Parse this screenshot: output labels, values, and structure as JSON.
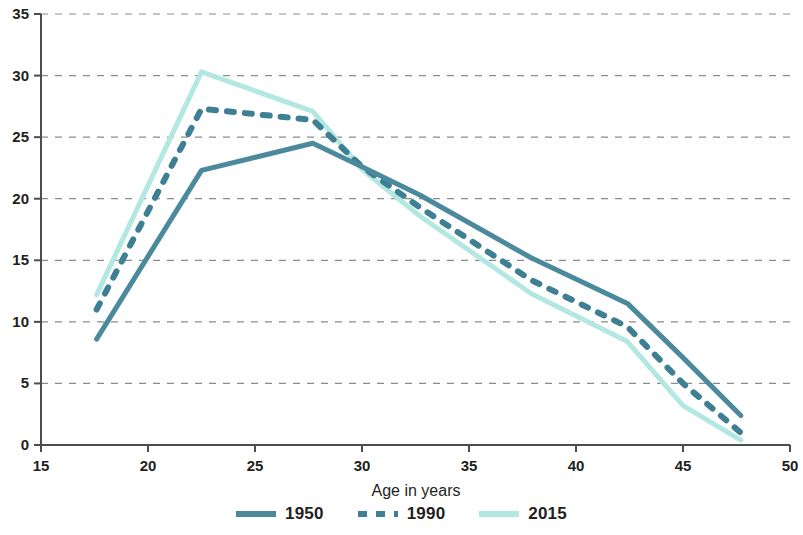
{
  "chart_data": {
    "type": "line",
    "title": "",
    "xlabel": "Age in years",
    "ylabel": "",
    "xlim": [
      15,
      50
    ],
    "ylim": [
      0,
      35
    ],
    "xticks": [
      15,
      20,
      25,
      30,
      35,
      40,
      45,
      50
    ],
    "yticks": [
      0,
      5,
      10,
      15,
      20,
      25,
      30,
      35
    ],
    "grid": "horizontal-dashed",
    "legend_position": "bottom-center",
    "series": [
      {
        "name": "1950",
        "color": "#4b8a9c",
        "style": "solid",
        "x": [
          17.6,
          22.5,
          27.7,
          30.0,
          32.7,
          37.9,
          42.4,
          45.0,
          47.7
        ],
        "y": [
          8.6,
          22.3,
          24.5,
          22.6,
          20.3,
          15.2,
          11.5,
          7.1,
          2.4
        ]
      },
      {
        "name": "1990",
        "color": "#3f7f93",
        "style": "dashed",
        "x": [
          17.6,
          22.5,
          27.7,
          30.0,
          32.7,
          37.9,
          42.4,
          45.0,
          47.7
        ],
        "y": [
          11.0,
          27.3,
          26.4,
          22.6,
          19.3,
          13.4,
          9.6,
          5.0,
          1.0
        ]
      },
      {
        "name": "2015",
        "color": "#b3e8e2",
        "style": "solid",
        "x": [
          17.6,
          22.5,
          27.7,
          30.0,
          32.7,
          37.9,
          42.4,
          45.0,
          47.7
        ],
        "y": [
          12.2,
          30.3,
          27.1,
          22.4,
          18.6,
          12.3,
          8.4,
          3.2,
          0.4
        ]
      }
    ]
  },
  "axes": {
    "x_title": "Age in years",
    "x_tick_labels": [
      "15",
      "20",
      "25",
      "30",
      "35",
      "40",
      "45",
      "50"
    ],
    "y_tick_labels": [
      "0",
      "5",
      "10",
      "15",
      "20",
      "25",
      "30",
      "35"
    ]
  },
  "legend": {
    "items": [
      {
        "label": "1950",
        "swatch": "solid-dark"
      },
      {
        "label": "1990",
        "swatch": "dashed-dark"
      },
      {
        "label": "2015",
        "swatch": "solid-light"
      }
    ]
  },
  "colors": {
    "series_1950": "#4b8a9c",
    "series_1990": "#3f7f93",
    "series_2015": "#b3e8e2",
    "axis": "#4d4d4d",
    "grid": "#8c8c8c",
    "text": "#231f20"
  }
}
